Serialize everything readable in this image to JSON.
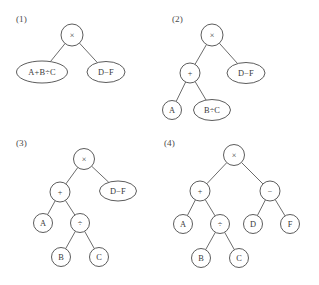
{
  "figure": {
    "background_color": "#ffffff",
    "stroke_color": "#4a4a4a",
    "text_color": "#3a3a3a",
    "width": 319,
    "height": 285
  },
  "panels": [
    {
      "caption": "(1)",
      "caption_x": 16,
      "caption_y": 22,
      "nodes": [
        {
          "id": "p1-root",
          "label": "×",
          "kind": "op",
          "shape": "circle",
          "cx": 72,
          "cy": 35,
          "rx": 11,
          "ry": 11
        },
        {
          "id": "p1-left",
          "label": "A+B÷C",
          "kind": "expr",
          "shape": "ellipse",
          "cx": 42,
          "cy": 72,
          "rx": 25.5,
          "ry": 11
        },
        {
          "id": "p1-right",
          "label": "D−F",
          "kind": "expr",
          "shape": "ellipse",
          "cx": 106,
          "cy": 72,
          "rx": 19,
          "ry": 10.5
        }
      ],
      "edges": [
        {
          "from": "p1-root",
          "to": "p1-left"
        },
        {
          "from": "p1-root",
          "to": "p1-right"
        }
      ]
    },
    {
      "caption": "(2)",
      "caption_x": 172,
      "caption_y": 22,
      "nodes": [
        {
          "id": "p2-root",
          "label": "×",
          "kind": "op",
          "shape": "circle",
          "cx": 212,
          "cy": 35,
          "rx": 11,
          "ry": 11
        },
        {
          "id": "p2-plus",
          "label": "+",
          "kind": "op",
          "shape": "circle",
          "cx": 190,
          "cy": 73,
          "rx": 10,
          "ry": 10
        },
        {
          "id": "p2-right",
          "label": "D−F",
          "kind": "expr",
          "shape": "ellipse",
          "cx": 246,
          "cy": 73,
          "rx": 19,
          "ry": 10.5
        },
        {
          "id": "p2-a",
          "label": "A",
          "kind": "var",
          "shape": "circle",
          "cx": 172,
          "cy": 110,
          "rx": 9.5,
          "ry": 9.5
        },
        {
          "id": "p2-bc",
          "label": "B÷C",
          "kind": "expr",
          "shape": "ellipse",
          "cx": 212,
          "cy": 110,
          "rx": 18.5,
          "ry": 10.5
        }
      ],
      "edges": [
        {
          "from": "p2-root",
          "to": "p2-plus"
        },
        {
          "from": "p2-root",
          "to": "p2-right"
        },
        {
          "from": "p2-plus",
          "to": "p2-a"
        },
        {
          "from": "p2-plus",
          "to": "p2-bc"
        }
      ]
    },
    {
      "caption": "(3)",
      "caption_x": 16,
      "caption_y": 146,
      "nodes": [
        {
          "id": "p3-root",
          "label": "×",
          "kind": "op",
          "shape": "circle",
          "cx": 84,
          "cy": 159,
          "rx": 10.5,
          "ry": 10.5
        },
        {
          "id": "p3-plus",
          "label": "+",
          "kind": "op",
          "shape": "circle",
          "cx": 60,
          "cy": 192,
          "rx": 10,
          "ry": 10
        },
        {
          "id": "p3-right",
          "label": "D−F",
          "kind": "expr",
          "shape": "ellipse",
          "cx": 118,
          "cy": 191,
          "rx": 18.5,
          "ry": 10
        },
        {
          "id": "p3-a",
          "label": "A",
          "kind": "var",
          "shape": "circle",
          "cx": 43,
          "cy": 223,
          "rx": 9.5,
          "ry": 9.5
        },
        {
          "id": "p3-div",
          "label": "÷",
          "kind": "op",
          "shape": "circle",
          "cx": 80,
          "cy": 223,
          "rx": 9.5,
          "ry": 9.5
        },
        {
          "id": "p3-b",
          "label": "B",
          "kind": "var",
          "shape": "circle",
          "cx": 61,
          "cy": 257,
          "rx": 9.5,
          "ry": 9.5
        },
        {
          "id": "p3-c",
          "label": "C",
          "kind": "var",
          "shape": "circle",
          "cx": 99,
          "cy": 257,
          "rx": 9.5,
          "ry": 9.5
        }
      ],
      "edges": [
        {
          "from": "p3-root",
          "to": "p3-plus"
        },
        {
          "from": "p3-root",
          "to": "p3-right"
        },
        {
          "from": "p3-plus",
          "to": "p3-a"
        },
        {
          "from": "p3-plus",
          "to": "p3-div"
        },
        {
          "from": "p3-div",
          "to": "p3-b"
        },
        {
          "from": "p3-div",
          "to": "p3-c"
        }
      ]
    },
    {
      "caption": "(4)",
      "caption_x": 164,
      "caption_y": 146,
      "nodes": [
        {
          "id": "p4-root",
          "label": "×",
          "kind": "op",
          "shape": "circle",
          "cx": 234,
          "cy": 155,
          "rx": 10.5,
          "ry": 10.5
        },
        {
          "id": "p4-plus",
          "label": "+",
          "kind": "op",
          "shape": "circle",
          "cx": 200,
          "cy": 191,
          "rx": 10,
          "ry": 10
        },
        {
          "id": "p4-minus",
          "label": "−",
          "kind": "op",
          "shape": "circle",
          "cx": 270,
          "cy": 191,
          "rx": 10,
          "ry": 10
        },
        {
          "id": "p4-a",
          "label": "A",
          "kind": "var",
          "shape": "circle",
          "cx": 183,
          "cy": 224,
          "rx": 9.5,
          "ry": 9.5
        },
        {
          "id": "p4-div",
          "label": "÷",
          "kind": "op",
          "shape": "circle",
          "cx": 220,
          "cy": 224,
          "rx": 9.5,
          "ry": 9.5
        },
        {
          "id": "p4-d",
          "label": "D",
          "kind": "var",
          "shape": "circle",
          "cx": 253,
          "cy": 224,
          "rx": 9.5,
          "ry": 9.5
        },
        {
          "id": "p4-f",
          "label": "F",
          "kind": "var",
          "shape": "circle",
          "cx": 290,
          "cy": 224,
          "rx": 9.5,
          "ry": 9.5
        },
        {
          "id": "p4-b",
          "label": "B",
          "kind": "var",
          "shape": "circle",
          "cx": 201,
          "cy": 258,
          "rx": 9.5,
          "ry": 9.5
        },
        {
          "id": "p4-c",
          "label": "C",
          "kind": "var",
          "shape": "circle",
          "cx": 239,
          "cy": 258,
          "rx": 9.5,
          "ry": 9.5
        }
      ],
      "edges": [
        {
          "from": "p4-root",
          "to": "p4-plus"
        },
        {
          "from": "p4-root",
          "to": "p4-minus"
        },
        {
          "from": "p4-plus",
          "to": "p4-a"
        },
        {
          "from": "p4-plus",
          "to": "p4-div"
        },
        {
          "from": "p4-minus",
          "to": "p4-d"
        },
        {
          "from": "p4-minus",
          "to": "p4-f"
        },
        {
          "from": "p4-div",
          "to": "p4-b"
        },
        {
          "from": "p4-div",
          "to": "p4-c"
        }
      ]
    }
  ]
}
